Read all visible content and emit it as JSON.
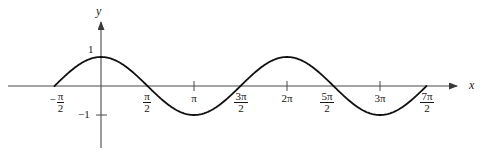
{
  "figure": {
    "kind": "cartesian-plot",
    "width": 492,
    "height": 156,
    "background": "#ffffff",
    "curve_color": "#111111",
    "axis_color": "#555555"
  },
  "axes": {
    "x_axis_label": "x",
    "y_axis_label": "y",
    "x_axis_y_px": 86,
    "y_axis_x_px": 101,
    "px_per_pi": 93,
    "amplitude_px": 29,
    "x_ticks": [
      {
        "label_parts": {
          "sign": "−",
          "numerator": "π",
          "denominator": "2"
        },
        "value_pi": -0.5,
        "tick_drawn": false
      },
      {
        "label_parts": {
          "sign": "",
          "numerator": "π",
          "denominator": "2"
        },
        "value_pi": 0.5,
        "tick_drawn": false
      },
      {
        "label_parts": {
          "sign": "",
          "numerator": "π",
          "denominator": ""
        },
        "value_pi": 1.0,
        "tick_drawn": true
      },
      {
        "label_parts": {
          "sign": "",
          "numerator": "3π",
          "denominator": "2"
        },
        "value_pi": 1.5,
        "tick_drawn": false
      },
      {
        "label_parts": {
          "sign": "",
          "numerator": "2π",
          "denominator": ""
        },
        "value_pi": 2.0,
        "tick_drawn": true
      },
      {
        "label_parts": {
          "sign": "",
          "numerator": "5π",
          "denominator": "2"
        },
        "value_pi": 2.5,
        "tick_drawn": false
      },
      {
        "label_parts": {
          "sign": "",
          "numerator": "3π",
          "denominator": ""
        },
        "value_pi": 3.0,
        "tick_drawn": true
      },
      {
        "label_parts": {
          "sign": "",
          "numerator": "7π",
          "denominator": "2"
        },
        "value_pi": 3.5,
        "tick_drawn": false
      }
    ],
    "y_ticks": [
      {
        "label": "1",
        "value": 1,
        "tick_drawn": false
      },
      {
        "label": "−1",
        "value": -1,
        "tick_drawn": true
      }
    ]
  },
  "chart_data": {
    "type": "line",
    "title": "",
    "subtitle": "",
    "xlabel": "x",
    "ylabel": "y",
    "xlim_pi": [
      -0.5,
      3.5
    ],
    "ylim": [
      -1,
      1
    ],
    "grid": false,
    "legend": null,
    "xtick_labels": [
      "-π/2",
      "π/2",
      "π",
      "3π/2",
      "2π",
      "5π/2",
      "3π",
      "7π/2"
    ],
    "xtick_values_pi": [
      -0.5,
      0.5,
      1.0,
      1.5,
      2.0,
      2.5,
      3.0,
      3.5
    ],
    "ytick_labels": [
      "1",
      "-1"
    ],
    "ytick_values": [
      1,
      -1
    ],
    "series": [
      {
        "name": "y = cos x",
        "formula": "cos(x)",
        "color": "#111111",
        "x_pi": [
          -0.5,
          -0.25,
          0,
          0.25,
          0.5,
          0.75,
          1.0,
          1.25,
          1.5,
          1.75,
          2.0,
          2.25,
          2.5,
          2.75,
          3.0,
          3.25,
          3.5
        ],
        "y": [
          0,
          0.707,
          1,
          0.707,
          0,
          -0.707,
          -1,
          -0.707,
          0,
          0.707,
          1,
          0.707,
          0,
          -0.707,
          -1,
          -0.707,
          0
        ]
      }
    ],
    "annotations": []
  }
}
